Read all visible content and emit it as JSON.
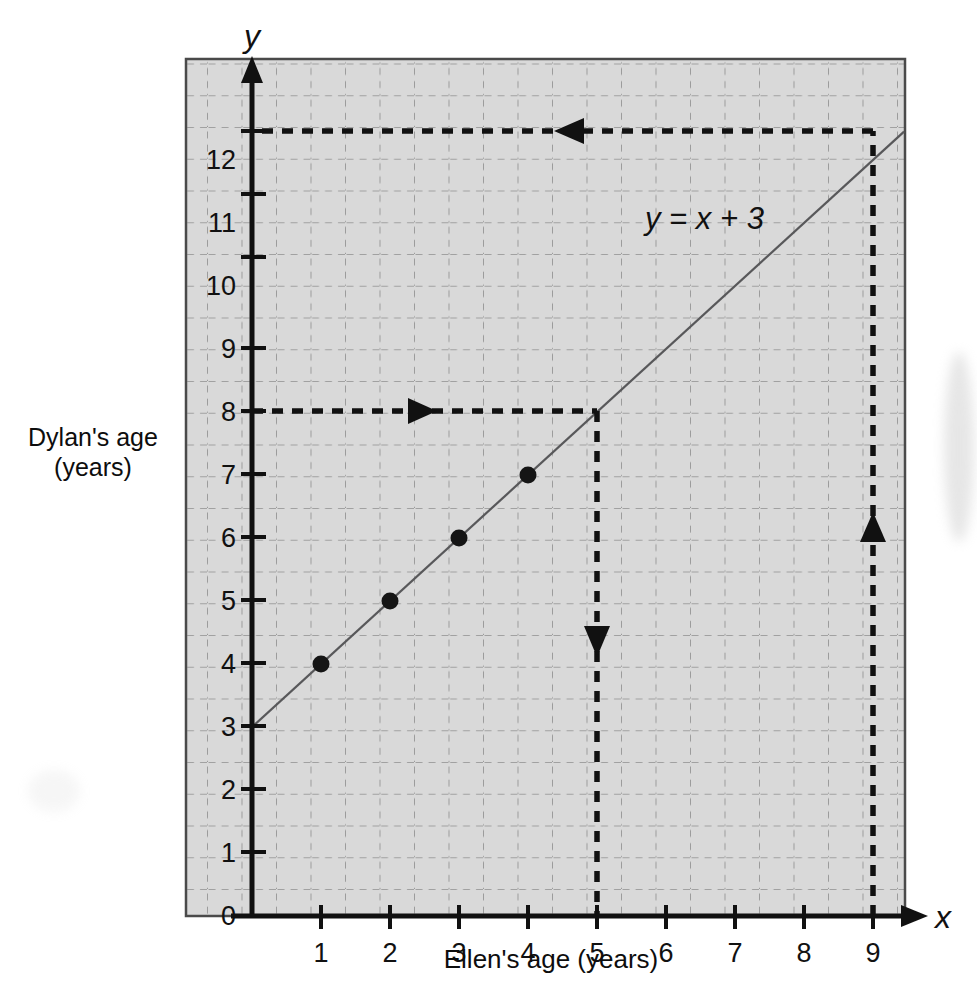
{
  "chart_data": {
    "type": "line",
    "title": "",
    "equation_label": "y = x + 3",
    "xlabel": "Ellen's age (years)",
    "ylabel": "Dylan's age\n(years)",
    "x_axis_symbol": "x",
    "y_axis_symbol": "y",
    "xlim": [
      0,
      9.6
    ],
    "ylim": [
      0,
      12.85
    ],
    "xticks": [
      0,
      1,
      2,
      3,
      4,
      5,
      6,
      7,
      8,
      9
    ],
    "xtick_labels": [
      "0",
      "1",
      "2",
      "3",
      "4",
      "5",
      "6",
      "7",
      "8",
      "9"
    ],
    "yticks": [
      0,
      1,
      2,
      3,
      4,
      5,
      6,
      7,
      8,
      9,
      10,
      11,
      12
    ],
    "ytick_labels": [
      "0",
      "1",
      "2",
      "3",
      "4",
      "5",
      "6",
      "7",
      "8",
      "9",
      "10",
      "11",
      "12"
    ],
    "grid": true,
    "grid_minor_step": 0.5,
    "grid_color": "#8e8e8e",
    "plot_background": "#d9d9d9",
    "line_color": "#58585a",
    "axis_color": "#111111",
    "series": [
      {
        "name": "y = x + 3",
        "x": [
          0,
          9.45
        ],
        "y": [
          3,
          12.45
        ],
        "points": [
          {
            "x": 1,
            "y": 4
          },
          {
            "x": 2,
            "y": 5
          },
          {
            "x": 3,
            "y": 6
          },
          {
            "x": 4,
            "y": 7
          }
        ]
      }
    ],
    "annotations": [
      {
        "name": "read-off-x5",
        "description": "From y = 8 on the y-axis across to the line at x = 5, then down to the x-axis",
        "segments": [
          {
            "from": [
              0,
              8
            ],
            "to": [
              5,
              8
            ],
            "direction": "right",
            "arrow_at": [
              2.5,
              8
            ]
          },
          {
            "from": [
              5,
              8
            ],
            "to": [
              5,
              0
            ],
            "direction": "down",
            "arrow_at": [
              5,
              4
            ]
          }
        ]
      },
      {
        "name": "read-off-x9",
        "description": "From x = 9 on the x-axis up to the line, then across to y = 12 on the y-axis",
        "segments": [
          {
            "from": [
              9,
              0
            ],
            "to": [
              9,
              12
            ],
            "direction": "up",
            "arrow_at": [
              9,
              6
            ]
          },
          {
            "from": [
              9,
              12
            ],
            "to": [
              0,
              12
            ],
            "direction": "left",
            "arrow_at": [
              4.3,
              12
            ]
          }
        ]
      }
    ]
  }
}
